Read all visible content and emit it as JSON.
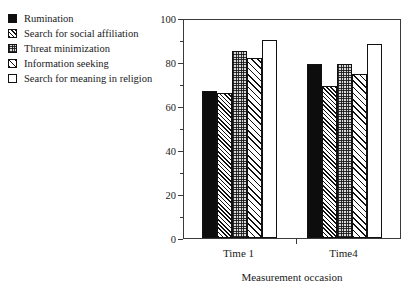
{
  "chart_data": {
    "type": "bar",
    "title": "",
    "xlabel": "Measurement occasion",
    "ylabel": "",
    "ylim": [
      0,
      100
    ],
    "ytick_values": [
      0,
      20,
      40,
      60,
      80,
      100
    ],
    "ytick_labels": [
      "0",
      "20",
      "40",
      "60",
      "80",
      "100"
    ],
    "yminor_values": [
      10,
      30,
      50,
      70,
      90
    ],
    "grid": false,
    "legend_position": "upper-left-outside",
    "categories": [
      "Time 1",
      "Time4"
    ],
    "series": [
      {
        "name": "Rumination",
        "fill": "solid",
        "values": [
          67,
          79
        ]
      },
      {
        "name": "Search for social affiliation",
        "fill": "hatch-dense",
        "values": [
          66,
          69
        ]
      },
      {
        "name": "Threat minimization",
        "fill": "stipple",
        "values": [
          85,
          79
        ]
      },
      {
        "name": "Information seeking",
        "fill": "hatch-light",
        "values": [
          82,
          74.5
        ]
      },
      {
        "name": "Search for meaning in religion",
        "fill": "empty",
        "values": [
          90,
          88
        ]
      }
    ]
  },
  "legend": {
    "items": [
      {
        "label": "Rumination",
        "fill": "solid"
      },
      {
        "label": "Search for social affiliation",
        "fill": "hatch-dense"
      },
      {
        "label": "Threat minimization",
        "fill": "stipple"
      },
      {
        "label": "Information seeking",
        "fill": "hatch-light"
      },
      {
        "label": "Search for meaning in religion",
        "fill": "empty"
      }
    ]
  },
  "colors": {
    "axis": "#3a3a3a",
    "bar_outline": "#111111",
    "solid_fill": "#0d0d0d",
    "stipple_fill": "#d9d9d9",
    "background": "#ffffff"
  }
}
